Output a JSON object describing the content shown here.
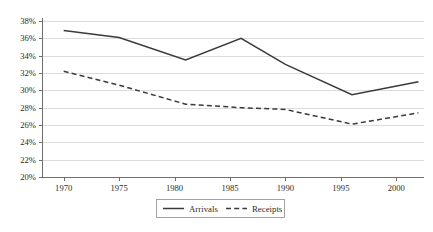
{
  "chart_data": {
    "type": "line",
    "title": "",
    "subtitle": "",
    "xlabel": "",
    "ylabel": "",
    "xlim": [
      1968,
      2002.5
    ],
    "ylim": [
      20,
      38
    ],
    "grid": true,
    "grid_axis": "y",
    "legend_position": "bottom-center",
    "y_tick_labels": [
      "38%",
      "36%",
      "34%",
      "32%",
      "30%",
      "28%",
      "26%",
      "24%",
      "22%",
      "20%"
    ],
    "y_tick_values": [
      38,
      36,
      34,
      32,
      30,
      28,
      26,
      24,
      22,
      20
    ],
    "x_tick_labels": [
      "1970",
      "1975",
      "1980",
      "1985",
      "1990",
      "1995",
      "2000"
    ],
    "x_tick_values": [
      1970,
      1975,
      1980,
      1985,
      1990,
      1995,
      2000
    ],
    "series": [
      {
        "name": "Arrivals",
        "style": "solid",
        "color": "#3a3a3a",
        "x": [
          1970,
          1975,
          1981,
          1986,
          1990,
          1996,
          2002
        ],
        "values": [
          36.9,
          36.1,
          33.5,
          36.0,
          33.0,
          29.5,
          31.0
        ]
      },
      {
        "name": "Receipts",
        "style": "dashed",
        "color": "#3a3a3a",
        "x": [
          1970,
          1975,
          1981,
          1986,
          1990,
          1996,
          2002
        ],
        "values": [
          32.2,
          30.6,
          28.4,
          28.0,
          27.8,
          26.1,
          27.4
        ]
      }
    ]
  },
  "legend": {
    "entries": [
      {
        "label": "Arrivals"
      },
      {
        "label": "Receipts"
      }
    ]
  },
  "colors": {
    "line": "#3a3a3a",
    "grid": "#dcdcdc",
    "axis": "#6e6e6e",
    "text": "#2b2b2b",
    "background": "#ffffff"
  }
}
